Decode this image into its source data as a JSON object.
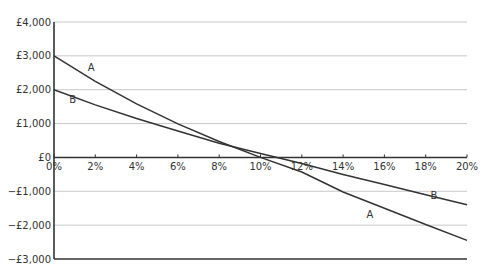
{
  "chart_data": {
    "type": "line",
    "title": "",
    "xlabel": "",
    "ylabel": "",
    "x": [
      0,
      2,
      4,
      6,
      8,
      10,
      12,
      14,
      16,
      18,
      20
    ],
    "x_tick_labels": [
      "0%",
      "2%",
      "4%",
      "6%",
      "8%",
      "10%",
      "12%",
      "14%",
      "16%",
      "18%",
      "20%"
    ],
    "y_ticks": [
      4000,
      3000,
      2000,
      1000,
      0,
      -1000,
      -2000,
      -3000
    ],
    "y_tick_labels": [
      "£4,000",
      "£3,000",
      "£2,000",
      "£1,000",
      "£0",
      "−£1,000",
      "−£2,000",
      "−£3,000"
    ],
    "ylim": [
      -3000,
      4000
    ],
    "xlim": [
      0,
      20
    ],
    "grid": true,
    "series": [
      {
        "name": "A",
        "values": [
          3000,
          2250,
          1580,
          990,
          470,
          0,
          -430,
          -1020,
          -1500,
          -1980,
          -2450
        ]
      },
      {
        "name": "B",
        "values": [
          2000,
          1550,
          1150,
          780,
          420,
          120,
          -180,
          -500,
          -800,
          -1100,
          -1400
        ]
      }
    ],
    "annotations": [
      {
        "text": "A",
        "x": 1.8,
        "y": 2550
      },
      {
        "text": "B",
        "x": 0.9,
        "y": 1620
      },
      {
        "text": "A",
        "x": 15.3,
        "y": -1780
      },
      {
        "text": "B",
        "x": 18.4,
        "y": -1220
      }
    ]
  }
}
